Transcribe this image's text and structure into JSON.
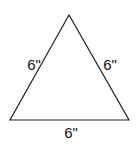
{
  "diagram": {
    "shape": "equilateral-triangle",
    "stroke_color": "#222222",
    "sides": {
      "left": "6\"",
      "right": "6\"",
      "bottom": "6\""
    }
  }
}
